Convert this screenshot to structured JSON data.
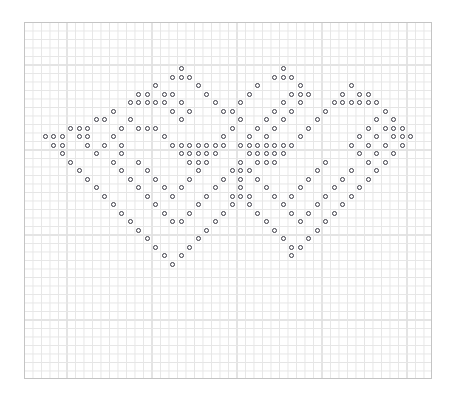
{
  "chart_data": {
    "type": "scatter",
    "title": "",
    "subtitle": "",
    "xlabel": "",
    "ylabel": "",
    "grid": true,
    "legend": null,
    "annotations": [],
    "symbol": "open-circle",
    "symbol_color": "#3c3c46",
    "grid_minor_color": "#e6e6e6",
    "grid_major_color": "#c4c4c4",
    "background_color": "#ffffff",
    "cell_size_px": 8.5,
    "major_every": 5,
    "grid_origin_px": [
      24,
      22
    ],
    "grid_cols": 48,
    "grid_rows": 42,
    "xlim": [
      0,
      48
    ],
    "ylim": [
      0,
      42
    ],
    "x": [
      18,
      16,
      17,
      18,
      14,
      15,
      16,
      17,
      18,
      19,
      20,
      21,
      22,
      23,
      24,
      25,
      26,
      27,
      28,
      29,
      30,
      31,
      32,
      33,
      34,
      35,
      36,
      37,
      38,
      39,
      40,
      41,
      42,
      43,
      44,
      45,
      46
    ],
    "points": [
      [
        18,
        5
      ],
      [
        17,
        6
      ],
      [
        18,
        6
      ],
      [
        19,
        6
      ],
      [
        30,
        4
      ],
      [
        29,
        5
      ],
      [
        30,
        5
      ],
      [
        31,
        5
      ],
      [
        8,
        8
      ],
      [
        15,
        7
      ],
      [
        20,
        7
      ],
      [
        28,
        7
      ],
      [
        32,
        7
      ],
      [
        39,
        7
      ],
      [
        7,
        8
      ],
      [
        9,
        8
      ],
      [
        14,
        8
      ],
      [
        16,
        8
      ],
      [
        17,
        8
      ],
      [
        21,
        8
      ],
      [
        27,
        8
      ],
      [
        32,
        8
      ],
      [
        33,
        8
      ],
      [
        38,
        8
      ],
      [
        40,
        8
      ],
      [
        6,
        9
      ],
      [
        7,
        9
      ],
      [
        8,
        9
      ],
      [
        9,
        9
      ],
      [
        10,
        9
      ],
      [
        15,
        9
      ],
      [
        18,
        9
      ],
      [
        22,
        9
      ],
      [
        26,
        9
      ],
      [
        29,
        9
      ],
      [
        32,
        9
      ],
      [
        36,
        9
      ],
      [
        37,
        9
      ],
      [
        38,
        9
      ],
      [
        39,
        9
      ],
      [
        40,
        9
      ],
      [
        41,
        9
      ],
      [
        4,
        10
      ],
      [
        11,
        10
      ],
      [
        16,
        10
      ],
      [
        17,
        10
      ],
      [
        23,
        10
      ],
      [
        25,
        10
      ],
      [
        30,
        10
      ],
      [
        31,
        10
      ],
      [
        35,
        10
      ],
      [
        42,
        10
      ],
      [
        3,
        11
      ],
      [
        8,
        11
      ],
      [
        13,
        11
      ],
      [
        24,
        11
      ],
      [
        34,
        11
      ],
      [
        39,
        11
      ],
      [
        43,
        11
      ],
      [
        2,
        11
      ],
      [
        2,
        12
      ],
      [
        3,
        12
      ],
      [
        7,
        12
      ],
      [
        8,
        12
      ],
      [
        9,
        12
      ],
      [
        14,
        12
      ],
      [
        23,
        12
      ],
      [
        24,
        12
      ],
      [
        25,
        12
      ],
      [
        33,
        12
      ],
      [
        38,
        12
      ],
      [
        39,
        12
      ],
      [
        40,
        12
      ],
      [
        43,
        12
      ],
      [
        44,
        12
      ],
      [
        1,
        13
      ],
      [
        2,
        13
      ],
      [
        3,
        13
      ],
      [
        6,
        13
      ],
      [
        10,
        13
      ],
      [
        15,
        13
      ],
      [
        23,
        13
      ],
      [
        32,
        13
      ],
      [
        37,
        13
      ],
      [
        41,
        13
      ],
      [
        43,
        13
      ],
      [
        44,
        13
      ],
      [
        45,
        13
      ],
      [
        2,
        14
      ],
      [
        3,
        14
      ],
      [
        6,
        14
      ],
      [
        8,
        14
      ],
      [
        10,
        14
      ],
      [
        11,
        14
      ],
      [
        16,
        14
      ],
      [
        17,
        14
      ],
      [
        18,
        14
      ],
      [
        19,
        14
      ],
      [
        20,
        14
      ],
      [
        21,
        14
      ],
      [
        22,
        14
      ],
      [
        24,
        14
      ],
      [
        25,
        14
      ],
      [
        26,
        14
      ],
      [
        27,
        14
      ],
      [
        28,
        14
      ],
      [
        29,
        14
      ],
      [
        30,
        14
      ],
      [
        31,
        14
      ],
      [
        36,
        14
      ],
      [
        37,
        14
      ],
      [
        39,
        14
      ],
      [
        41,
        14
      ],
      [
        43,
        14
      ],
      [
        44,
        14
      ],
      [
        3,
        15
      ],
      [
        7,
        15
      ],
      [
        10,
        15
      ],
      [
        17,
        15
      ],
      [
        18,
        15
      ],
      [
        19,
        15
      ],
      [
        20,
        15
      ],
      [
        21,
        15
      ],
      [
        24,
        15
      ],
      [
        26,
        15
      ],
      [
        27,
        15
      ],
      [
        28,
        15
      ],
      [
        29,
        15
      ],
      [
        30,
        15
      ],
      [
        37,
        15
      ],
      [
        40,
        15
      ],
      [
        43,
        15
      ],
      [
        4,
        16
      ],
      [
        9,
        16
      ],
      [
        12,
        16
      ],
      [
        18,
        16
      ],
      [
        19,
        16
      ],
      [
        20,
        16
      ],
      [
        24,
        16
      ],
      [
        27,
        16
      ],
      [
        28,
        16
      ],
      [
        29,
        16
      ],
      [
        34,
        16
      ],
      [
        38,
        16
      ],
      [
        42,
        16
      ],
      [
        5,
        17
      ],
      [
        10,
        17
      ],
      [
        13,
        17
      ],
      [
        19,
        17
      ],
      [
        23,
        17
      ],
      [
        24,
        17
      ],
      [
        25,
        17
      ],
      [
        33,
        17
      ],
      [
        37,
        17
      ],
      [
        41,
        17
      ],
      [
        6,
        18
      ],
      [
        11,
        18
      ],
      [
        14,
        18
      ],
      [
        18,
        18
      ],
      [
        22,
        18
      ],
      [
        24,
        18
      ],
      [
        26,
        18
      ],
      [
        32,
        18
      ],
      [
        36,
        18
      ],
      [
        40,
        18
      ],
      [
        7,
        19
      ],
      [
        12,
        19
      ],
      [
        15,
        19
      ],
      [
        17,
        19
      ],
      [
        21,
        19
      ],
      [
        24,
        19
      ],
      [
        27,
        19
      ],
      [
        31,
        19
      ],
      [
        35,
        19
      ],
      [
        39,
        19
      ],
      [
        8,
        20
      ],
      [
        13,
        20
      ],
      [
        16,
        20
      ],
      [
        20,
        20
      ],
      [
        23,
        20
      ],
      [
        24,
        20
      ],
      [
        25,
        20
      ],
      [
        28,
        20
      ],
      [
        30,
        20
      ],
      [
        34,
        20
      ],
      [
        38,
        20
      ],
      [
        9,
        21
      ],
      [
        14,
        21
      ],
      [
        19,
        21
      ],
      [
        23,
        21
      ],
      [
        25,
        21
      ],
      [
        29,
        21
      ],
      [
        33,
        21
      ],
      [
        37,
        21
      ],
      [
        10,
        22
      ],
      [
        15,
        22
      ],
      [
        18,
        22
      ],
      [
        22,
        22
      ],
      [
        26,
        22
      ],
      [
        30,
        22
      ],
      [
        32,
        22
      ],
      [
        36,
        22
      ],
      [
        11,
        23
      ],
      [
        16,
        23
      ],
      [
        17,
        23
      ],
      [
        21,
        23
      ],
      [
        27,
        23
      ],
      [
        31,
        23
      ],
      [
        35,
        23
      ],
      [
        12,
        24
      ],
      [
        20,
        24
      ],
      [
        28,
        24
      ],
      [
        34,
        24
      ],
      [
        13,
        25
      ],
      [
        19,
        25
      ],
      [
        29,
        25
      ],
      [
        33,
        25
      ],
      [
        14,
        26
      ],
      [
        18,
        26
      ],
      [
        30,
        26
      ],
      [
        32,
        26
      ],
      [
        15,
        27
      ],
      [
        17,
        27
      ],
      [
        31,
        27
      ],
      [
        16,
        28
      ]
    ],
    "x_tick_labels": [],
    "y_tick_labels": []
  },
  "pattern": {
    "rows": [
      {
        "y": 5,
        "xs": [
          18,
          30
        ]
      },
      {
        "y": 6,
        "xs": [
          17,
          18,
          19,
          29,
          30,
          31
        ]
      },
      {
        "y": 7,
        "xs": [
          15,
          20,
          27,
          32,
          38
        ]
      },
      {
        "y": 8,
        "xs": [
          13,
          14,
          16,
          17,
          21,
          26,
          31,
          32,
          33,
          37,
          39,
          40
        ]
      },
      {
        "y": 9,
        "xs": [
          12,
          13,
          14,
          15,
          16,
          18,
          22,
          25,
          30,
          32,
          36,
          37,
          38,
          39,
          40,
          41
        ]
      },
      {
        "y": 10,
        "xs": [
          10,
          17,
          19,
          23,
          24,
          29,
          31,
          35,
          42
        ]
      },
      {
        "y": 11,
        "xs": [
          8,
          9,
          12,
          18,
          25,
          28,
          30,
          34,
          41,
          43
        ]
      },
      {
        "y": 12,
        "xs": [
          5,
          6,
          7,
          11,
          13,
          14,
          15,
          24,
          27,
          29,
          33,
          40,
          42,
          43,
          44
        ]
      },
      {
        "y": 13,
        "xs": [
          2,
          3,
          4,
          6,
          7,
          10,
          16,
          23,
          26,
          28,
          32,
          39,
          41,
          43,
          44,
          45
        ]
      },
      {
        "y": 14,
        "xs": [
          3,
          4,
          7,
          9,
          11,
          17,
          18,
          19,
          20,
          21,
          22,
          23,
          25,
          26,
          27,
          28,
          29,
          30,
          31,
          38,
          40,
          42,
          44
        ]
      },
      {
        "y": 15,
        "xs": [
          4,
          8,
          11,
          18,
          19,
          20,
          21,
          22,
          26,
          27,
          28,
          29,
          30,
          39,
          41,
          43
        ]
      },
      {
        "y": 16,
        "xs": [
          5,
          10,
          13,
          19,
          20,
          21,
          25,
          27,
          28,
          29,
          35,
          40,
          42
        ]
      },
      {
        "y": 17,
        "xs": [
          6,
          11,
          14,
          20,
          24,
          25,
          26,
          34,
          38,
          41
        ]
      },
      {
        "y": 18,
        "xs": [
          7,
          12,
          15,
          19,
          23,
          25,
          27,
          33,
          37,
          40
        ]
      },
      {
        "y": 19,
        "xs": [
          8,
          13,
          16,
          18,
          22,
          25,
          28,
          32,
          36,
          39
        ]
      },
      {
        "y": 20,
        "xs": [
          9,
          14,
          17,
          21,
          24,
          25,
          26,
          29,
          31,
          35,
          38
        ]
      },
      {
        "y": 21,
        "xs": [
          10,
          15,
          20,
          24,
          26,
          30,
          34,
          37
        ]
      },
      {
        "y": 22,
        "xs": [
          11,
          16,
          19,
          23,
          27,
          31,
          33,
          36
        ]
      },
      {
        "y": 23,
        "xs": [
          12,
          17,
          18,
          22,
          28,
          32,
          35
        ]
      },
      {
        "y": 24,
        "xs": [
          13,
          21,
          29,
          34
        ]
      },
      {
        "y": 25,
        "xs": [
          14,
          20,
          30,
          33
        ]
      },
      {
        "y": 26,
        "xs": [
          15,
          19,
          31,
          32
        ]
      },
      {
        "y": 27,
        "xs": [
          16,
          18,
          31
        ]
      },
      {
        "y": 28,
        "xs": [
          17
        ]
      }
    ],
    "symbol_name": "open-circle-stitch"
  }
}
